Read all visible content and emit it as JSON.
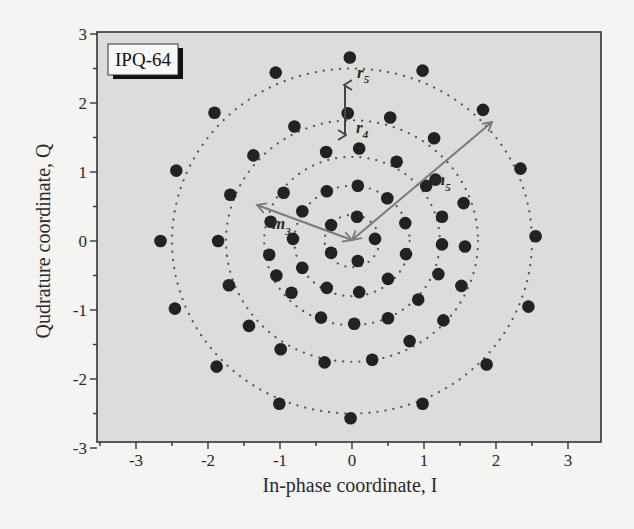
{
  "chart_data": {
    "type": "scatter",
    "title": "",
    "legend_label": "IPQ-64",
    "xlabel": "In-phase coordinate, I",
    "ylabel": "Qudrature coordinate, Q",
    "xlim": [
      -3.45,
      3.45
    ],
    "ylim": [
      -3,
      3
    ],
    "xticks": [
      -3,
      -2,
      -1,
      0,
      1,
      2,
      3
    ],
    "yticks": [
      -3,
      -2,
      -1,
      0,
      1,
      2,
      3
    ],
    "xtick_labels": [
      "-3",
      "-2",
      "-1",
      "0",
      "1",
      "2",
      "3"
    ],
    "ytick_labels": [
      "-3",
      "-2",
      "-1",
      "0",
      "1",
      "2",
      "3"
    ],
    "grid": false,
    "rings_dotted": [
      0.38,
      0.8,
      1.22,
      1.75,
      2.5
    ],
    "annotations": [
      {
        "label": "r",
        "sub": "5",
        "type": "text"
      },
      {
        "label": "r",
        "sub": "4",
        "type": "text"
      },
      {
        "label": "m",
        "sub": "3",
        "type": "arrow-label"
      },
      {
        "label": "m",
        "sub": "5",
        "type": "arrow-label"
      }
    ],
    "series": [
      {
        "name": "constellation points",
        "points": [
          [
            0.07,
            0.35
          ],
          [
            0.32,
            0.03
          ],
          [
            0.08,
            -0.29
          ],
          [
            -0.29,
            -0.17
          ],
          [
            -0.29,
            0.23
          ],
          [
            -0.35,
            0.72
          ],
          [
            0.08,
            0.8
          ],
          [
            0.49,
            0.62
          ],
          [
            0.74,
            0.26
          ],
          [
            0.75,
            -0.19
          ],
          [
            0.5,
            -0.55
          ],
          [
            0.1,
            -0.74
          ],
          [
            -0.35,
            -0.68
          ],
          [
            -0.69,
            -0.39
          ],
          [
            -0.82,
            0.03
          ],
          [
            -0.69,
            0.43
          ],
          [
            -0.36,
            1.29
          ],
          [
            0.1,
            1.34
          ],
          [
            0.62,
            1.15
          ],
          [
            1.03,
            0.8
          ],
          [
            1.25,
            0.35
          ],
          [
            1.25,
            -0.05
          ],
          [
            1.2,
            -0.48
          ],
          [
            0.92,
            -0.85
          ],
          [
            0.5,
            -1.12
          ],
          [
            0.03,
            -1.2
          ],
          [
            -0.43,
            -1.11
          ],
          [
            -0.84,
            -0.75
          ],
          [
            -1.05,
            -0.5
          ],
          [
            -1.15,
            -0.2
          ],
          [
            -1.13,
            0.28
          ],
          [
            -0.95,
            0.7
          ],
          [
            -0.06,
            1.85
          ],
          [
            0.53,
            1.79
          ],
          [
            1.14,
            1.49
          ],
          [
            1.16,
            0.89
          ],
          [
            1.55,
            0.55
          ],
          [
            1.57,
            -0.08
          ],
          [
            1.52,
            -0.65
          ],
          [
            1.27,
            -1.15
          ],
          [
            0.8,
            -1.45
          ],
          [
            0.28,
            -1.72
          ],
          [
            -0.38,
            -1.76
          ],
          [
            -0.99,
            -1.57
          ],
          [
            -1.43,
            -1.23
          ],
          [
            -1.71,
            -0.64
          ],
          [
            -1.86,
            0.0
          ],
          [
            -1.69,
            0.67
          ],
          [
            -1.37,
            1.24
          ],
          [
            -0.8,
            1.66
          ],
          [
            -0.03,
            2.66
          ],
          [
            0.98,
            2.47
          ],
          [
            1.82,
            1.9
          ],
          [
            2.34,
            1.05
          ],
          [
            2.55,
            0.07
          ],
          [
            2.45,
            -0.95
          ],
          [
            1.87,
            -1.79
          ],
          [
            0.98,
            -2.36
          ],
          [
            -0.02,
            -2.57
          ],
          [
            -1.01,
            -2.36
          ],
          [
            -1.88,
            -1.82
          ],
          [
            -2.46,
            -0.98
          ],
          [
            -2.66,
            0.0
          ],
          [
            -2.44,
            1.02
          ],
          [
            -1.91,
            1.86
          ],
          [
            -1.06,
            2.44
          ]
        ]
      }
    ]
  },
  "legend": {
    "label": "IPQ-64"
  },
  "axes": {
    "xlabel": "In-phase coordinate, I",
    "ylabel": "Qudrature coordinate, Q"
  },
  "annotations": {
    "r5": {
      "main": "r",
      "sub": "5"
    },
    "r4": {
      "main": "r",
      "sub": "4"
    },
    "m3": {
      "main": "m",
      "sub": "3"
    },
    "m5": {
      "main": "m",
      "sub": "5"
    }
  },
  "colors": {
    "plot_bg": "#dcdcda",
    "page_bg": "#f4f4f2",
    "dot": "#222222",
    "ring": "#555555",
    "arrow": "#7a7a7a",
    "frame": "#333333"
  }
}
